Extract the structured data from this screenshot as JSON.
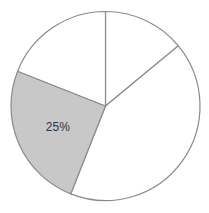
{
  "chart_data": {
    "type": "pie",
    "title": "",
    "start_angle_deg": 0,
    "direction": "clockwise",
    "slices": [
      {
        "label": "",
        "value": 14,
        "fill": "#ffffff",
        "show_label": false
      },
      {
        "label": "",
        "value": 42,
        "fill": "#ffffff",
        "show_label": false
      },
      {
        "label": "25%",
        "value": 25,
        "fill": "#c8c8c8",
        "show_label": true
      },
      {
        "label": "",
        "value": 19,
        "fill": "#ffffff",
        "show_label": false
      }
    ],
    "stroke": "#8a8a8a",
    "legend": "none"
  }
}
